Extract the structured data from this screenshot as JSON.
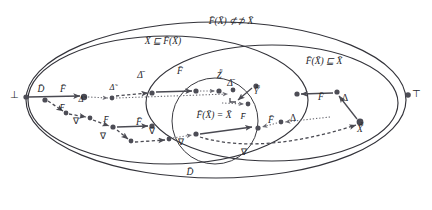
{
  "figure": {
    "kind": "lattice-fixpoint-diagram",
    "background": "#ffffff",
    "ink_color": "#33333a",
    "node_color": "#4d4d56",
    "width": 432,
    "height": 210
  },
  "region_labels": {
    "outer_ellipse": "F̄(X̄) ⊄⊅ X̄",
    "left_ellipse": "X̄ ⊑ F̄(X̄)",
    "right_ellipse": "F̄(X̄) ⊑ X̄",
    "center_circle": "F̄(X̄) = X̄",
    "bottom_region": "D̄"
  },
  "extreme_points": {
    "bottom_element": "⊥",
    "top_element": "⊤"
  },
  "node_labels": {
    "domain": "D̄",
    "functor": "F̄",
    "delta_bar": "Δ̄",
    "delta_tilde": "Δ̃",
    "delta_plain": "Δ",
    "nabla": "∇",
    "z_n": "Z̄",
    "z_n_sup": "n",
    "y_m": "Ȳ",
    "y_m_sup": "m",
    "x_n": "X̄",
    "x_n_sup": "n"
  },
  "annotations": [
    {
      "id": "a1",
      "text": "D̄",
      "x": 41,
      "y": 90,
      "size": "lbl-md"
    },
    {
      "id": "a2",
      "text": "F̄",
      "x": 63,
      "y": 90,
      "size": "lbl-md"
    },
    {
      "id": "a3",
      "text": "F̄",
      "x": 62,
      "y": 108,
      "size": "lbl-sm"
    },
    {
      "id": "a4",
      "text": "Δ̃",
      "x": 81,
      "y": 100,
      "size": "lbl-sm"
    },
    {
      "id": "a5",
      "text": "∇",
      "x": 76,
      "y": 122,
      "size": "lbl-sm"
    },
    {
      "id": "a6",
      "text": "F̄",
      "x": 106,
      "y": 120,
      "size": "lbl-sm"
    },
    {
      "id": "a7",
      "text": "∇",
      "x": 103,
      "y": 137,
      "size": "lbl-sm"
    },
    {
      "id": "a8",
      "text": "F̄",
      "x": 139,
      "y": 123,
      "size": "lbl-md"
    },
    {
      "id": "a9",
      "text": "∇",
      "x": 152,
      "y": 132,
      "size": "lbl-sm"
    },
    {
      "id": "a10",
      "text": "Δ̃",
      "x": 112,
      "y": 88,
      "size": "lbl-sm"
    },
    {
      "id": "a11",
      "text": "Δ̄",
      "x": 140,
      "y": 76,
      "size": "lbl-md"
    },
    {
      "id": "a12",
      "text": "F̄",
      "x": 180,
      "y": 72,
      "size": "lbl-md"
    },
    {
      "id": "a13",
      "text": "Δ̄",
      "x": 230,
      "y": 84,
      "size": "lbl-md"
    },
    {
      "id": "a14",
      "text": "F̄",
      "x": 321,
      "y": 98,
      "size": "lbl-md"
    },
    {
      "id": "a15",
      "text": "Δ",
      "x": 345,
      "y": 99,
      "size": "lbl-md"
    },
    {
      "id": "a16",
      "text": "Δ",
      "x": 293,
      "y": 119,
      "size": "lbl-md"
    },
    {
      "id": "a17",
      "text": "F̄",
      "x": 271,
      "y": 121,
      "size": "lbl-md"
    },
    {
      "id": "a18",
      "text": "F̄",
      "x": 243,
      "y": 117,
      "size": "lbl-sm"
    },
    {
      "id": "a19",
      "text": "∇",
      "x": 244,
      "y": 153,
      "size": "lbl-sm"
    },
    {
      "id": "a20",
      "text": "∇",
      "x": 181,
      "y": 143,
      "size": "lbl-sm"
    }
  ],
  "nodes": [
    {
      "id": "n-bot",
      "x": 26,
      "y": 97,
      "r": 2.6
    },
    {
      "id": "n-d1",
      "x": 45,
      "y": 100,
      "r": 2.6
    },
    {
      "id": "n-f1",
      "x": 84,
      "y": 97,
      "r": 3.2
    },
    {
      "id": "n-t1",
      "x": 112,
      "y": 98,
      "r": 2.4
    },
    {
      "id": "n-t2",
      "x": 152,
      "y": 93,
      "r": 2.6
    },
    {
      "id": "n-t3",
      "x": 196,
      "y": 91,
      "r": 2.6
    },
    {
      "id": "n-t4",
      "x": 219,
      "y": 91,
      "r": 2.6
    },
    {
      "id": "n-z",
      "x": 233,
      "y": 90,
      "r": 2.4
    },
    {
      "id": "n-y",
      "x": 256,
      "y": 86,
      "r": 2.6
    },
    {
      "id": "n-ym",
      "x": 248,
      "y": 104,
      "r": 2.4
    },
    {
      "id": "n-r1",
      "x": 297,
      "y": 94,
      "r": 2.6
    },
    {
      "id": "n-r2",
      "x": 337,
      "y": 92,
      "r": 2.6
    },
    {
      "id": "n-xn",
      "x": 360,
      "y": 122,
      "r": 3.4
    },
    {
      "id": "n-m1",
      "x": 258,
      "y": 128,
      "r": 2.6
    },
    {
      "id": "n-m2",
      "x": 281,
      "y": 122,
      "r": 2.4
    },
    {
      "id": "n-l1",
      "x": 66,
      "y": 113,
      "r": 2.4
    },
    {
      "id": "n-l2",
      "x": 90,
      "y": 118,
      "r": 2.4
    },
    {
      "id": "n-l3",
      "x": 113,
      "y": 127,
      "r": 2.6
    },
    {
      "id": "n-l4",
      "x": 152,
      "y": 126,
      "r": 2.6
    },
    {
      "id": "n-l5",
      "x": 131,
      "y": 141,
      "r": 2.4
    },
    {
      "id": "n-l6",
      "x": 169,
      "y": 139,
      "r": 2.4
    },
    {
      "id": "n-l7",
      "x": 196,
      "y": 134,
      "r": 2.6
    },
    {
      "id": "n-top",
      "x": 408,
      "y": 95,
      "r": 2.8
    }
  ]
}
